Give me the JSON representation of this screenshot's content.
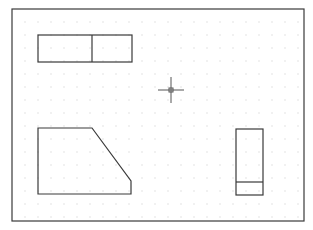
{
  "drawing": {
    "background": "#ffffff",
    "line_color": "#3a3a3a",
    "grid_color": "#c8c8c8",
    "frame": {
      "x1": 12,
      "y1": 9,
      "x2": 304,
      "y2": 221
    },
    "grid": {
      "start_x": 25,
      "start_y": 22,
      "step": 13
    },
    "shapes": [
      {
        "name": "top-left-rectangle",
        "type": "rect",
        "x": 38,
        "y": 35,
        "w": 94,
        "h": 27,
        "divider": {
          "axis": "vertical",
          "pos": 92
        }
      },
      {
        "name": "trapezoid",
        "type": "polygon",
        "points": "38,128 92,128 131,181 131,194 38,194"
      },
      {
        "name": "right-rectangle",
        "type": "rect",
        "x": 236,
        "y": 129,
        "w": 27,
        "h": 66,
        "divider": {
          "axis": "horizontal",
          "pos": 182
        }
      }
    ],
    "cursor": {
      "x": 171,
      "y": 90,
      "arm": 13,
      "box": 4
    }
  }
}
